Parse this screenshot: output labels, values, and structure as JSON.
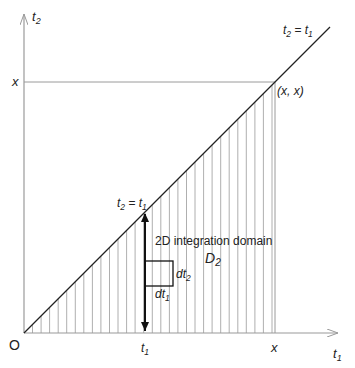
{
  "diagram": {
    "type": "2D integration domain",
    "colors": {
      "axis": "#9a9a9a",
      "diagonal": "#222222",
      "hatch": "#9a9a9a",
      "arrow": "#111111",
      "text": "#222222"
    },
    "axes": {
      "x_label": "t",
      "x_label_sub": "1",
      "y_label": "t",
      "y_label_sub": "2",
      "origin_label": "O"
    },
    "ticks": {
      "x_tick_t1": "t",
      "x_tick_t1_sub": "1",
      "x_tick_x": "x",
      "y_tick_x": "x"
    },
    "annotations": {
      "diagonal_top_label_left": "t",
      "diagonal_top_label_left_sub": "2",
      "diagonal_top_label_eq": " = ",
      "diagonal_top_label_right": "t",
      "diagonal_top_label_right_sub": "1",
      "corner_point": "(x, x)",
      "arrow_label_left": "t",
      "arrow_label_left_sub": "2",
      "arrow_label_eq": " = ",
      "arrow_label_right": "t",
      "arrow_label_right_sub": "1",
      "domain_caption": "2D integration domain",
      "domain_name": "D",
      "domain_name_sub": "2",
      "dt2_label": "dt",
      "dt2_sub": "2",
      "dt1_label": "dt",
      "dt1_sub": "1"
    }
  }
}
